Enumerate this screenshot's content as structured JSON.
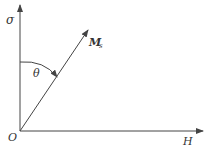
{
  "diagram": {
    "axes": {
      "vertical_label": "σ",
      "horizontal_label": "H",
      "origin_label": "O"
    },
    "vector": {
      "label_main": "M",
      "label_sub": "s"
    },
    "angle": {
      "label": "θ"
    },
    "colors": {
      "line": "#444444",
      "text": "#333333",
      "background": "#ffffff"
    }
  }
}
